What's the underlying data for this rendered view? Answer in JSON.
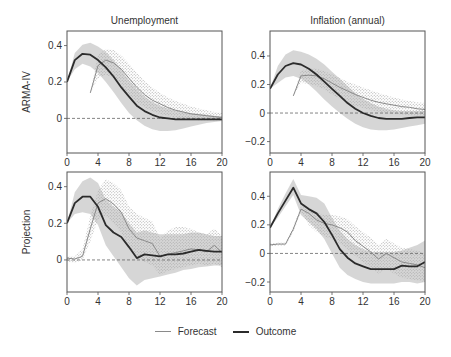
{
  "chart_data": {
    "type": "line",
    "layout": "2x2 grid of line charts with shaded uncertainty bands",
    "columns": [
      "Unemployment",
      "Inflation (annual)"
    ],
    "rows": [
      "ARMA-IV",
      "Projection"
    ],
    "legend": {
      "position": "bottom-center",
      "entries": [
        {
          "label": "Forecast",
          "color": "#8a8a8a",
          "width": 1
        },
        {
          "label": "Outcome",
          "color": "#2b2b2b",
          "width": 2
        }
      ]
    },
    "x_ticks": [
      0,
      4,
      8,
      12,
      16,
      20
    ],
    "xlim": [
      0,
      20
    ],
    "grid": false,
    "zero_line": "dashed",
    "panels": [
      {
        "id": "arma-unemployment",
        "row": "ARMA-IV",
        "column": "Unemployment",
        "ylim": [
          -0.19,
          0.48
        ],
        "y_ticks": [
          0,
          0.2,
          0.4
        ],
        "y_tick_labels": [
          "0",
          "0.2",
          "0.4"
        ],
        "outcome": {
          "x": [
            0,
            1,
            2,
            3,
            4,
            5,
            6,
            7,
            8,
            9,
            10,
            11,
            12,
            13,
            14,
            15,
            16,
            17,
            18,
            19,
            20
          ],
          "y": [
            0.2,
            0.32,
            0.355,
            0.35,
            0.32,
            0.28,
            0.23,
            0.17,
            0.12,
            0.07,
            0.04,
            0.02,
            0.005,
            0.0,
            -0.005,
            -0.005,
            -0.005,
            -0.005,
            -0.005,
            -0.005,
            -0.005
          ]
        },
        "outcome_band": {
          "lower": [
            0.2,
            0.27,
            0.3,
            0.285,
            0.25,
            0.2,
            0.145,
            0.085,
            0.03,
            -0.01,
            -0.04,
            -0.06,
            -0.07,
            -0.07,
            -0.065,
            -0.055,
            -0.045,
            -0.035,
            -0.025,
            -0.02,
            -0.015
          ],
          "upper": [
            0.2,
            0.36,
            0.405,
            0.415,
            0.395,
            0.365,
            0.32,
            0.265,
            0.21,
            0.16,
            0.12,
            0.09,
            0.07,
            0.055,
            0.045,
            0.035,
            0.03,
            0.025,
            0.02,
            0.015,
            0.01
          ]
        },
        "forecast": {
          "x": [
            3,
            4,
            5,
            6,
            7,
            8,
            9,
            10,
            11,
            12,
            13,
            14,
            15,
            16,
            17,
            18,
            19,
            20
          ],
          "y": [
            0.14,
            0.29,
            0.32,
            0.305,
            0.27,
            0.22,
            0.17,
            0.13,
            0.1,
            0.08,
            0.06,
            0.045,
            0.035,
            0.025,
            0.02,
            0.015,
            0.01,
            0.005
          ]
        },
        "forecast_band": {
          "lower": [
            0.14,
            0.22,
            0.24,
            0.22,
            0.18,
            0.13,
            0.09,
            0.06,
            0.04,
            0.025,
            0.015,
            0.005,
            0.0,
            -0.005,
            -0.01,
            -0.01,
            -0.01,
            -0.01
          ],
          "upper": [
            0.14,
            0.35,
            0.38,
            0.375,
            0.345,
            0.3,
            0.25,
            0.205,
            0.17,
            0.14,
            0.115,
            0.095,
            0.08,
            0.065,
            0.055,
            0.045,
            0.035,
            0.03
          ]
        }
      },
      {
        "id": "arma-inflation",
        "row": "ARMA-IV",
        "column": "Inflation (annual)",
        "ylim": [
          -0.28,
          0.575
        ],
        "y_ticks": [
          -0.2,
          0,
          0.2,
          0.4
        ],
        "y_tick_labels": [
          "−0.2",
          "0",
          "0.2",
          "0.4"
        ],
        "outcome": {
          "x": [
            0,
            1,
            2,
            3,
            4,
            5,
            6,
            7,
            8,
            9,
            10,
            11,
            12,
            13,
            14,
            15,
            16,
            17,
            18,
            19,
            20
          ],
          "y": [
            0.17,
            0.27,
            0.33,
            0.35,
            0.34,
            0.31,
            0.27,
            0.22,
            0.17,
            0.12,
            0.07,
            0.03,
            0.0,
            -0.02,
            -0.035,
            -0.04,
            -0.04,
            -0.04,
            -0.035,
            -0.03,
            -0.03
          ]
        },
        "outcome_band": {
          "lower": [
            0.17,
            0.21,
            0.25,
            0.26,
            0.24,
            0.2,
            0.15,
            0.095,
            0.045,
            0.0,
            -0.04,
            -0.075,
            -0.1,
            -0.115,
            -0.12,
            -0.12,
            -0.115,
            -0.105,
            -0.095,
            -0.085,
            -0.075
          ]
        },
        "outcome_band_upper": [
          0.17,
          0.33,
          0.41,
          0.44,
          0.43,
          0.41,
          0.38,
          0.34,
          0.29,
          0.24,
          0.19,
          0.14,
          0.1,
          0.07,
          0.045,
          0.03,
          0.02,
          0.015,
          0.015,
          0.015,
          0.015
        ],
        "forecast": {
          "x": [
            3,
            4,
            5,
            6,
            7,
            8,
            9,
            10,
            11,
            12,
            13,
            14,
            15,
            16,
            17,
            18,
            19,
            20
          ],
          "y": [
            0.12,
            0.26,
            0.265,
            0.26,
            0.24,
            0.21,
            0.18,
            0.155,
            0.13,
            0.11,
            0.09,
            0.075,
            0.065,
            0.055,
            0.045,
            0.04,
            0.03,
            0.025
          ]
        },
        "forecast_band": {
          "lower": [
            0.12,
            0.21,
            0.205,
            0.19,
            0.165,
            0.13,
            0.1,
            0.075,
            0.05,
            0.035,
            0.02,
            0.01,
            0.0,
            -0.005,
            -0.01,
            -0.015,
            -0.02,
            -0.02
          ],
          "upper": [
            0.12,
            0.3,
            0.31,
            0.31,
            0.295,
            0.27,
            0.245,
            0.22,
            0.2,
            0.18,
            0.16,
            0.14,
            0.125,
            0.11,
            0.095,
            0.085,
            0.075,
            0.07
          ]
        }
      },
      {
        "id": "projection-unemployment",
        "row": "Projection",
        "column": "Unemployment",
        "ylim": [
          -0.175,
          0.48
        ],
        "y_ticks": [
          0,
          0.2,
          0.4
        ],
        "y_tick_labels": [
          "0",
          "0.2",
          "0.4"
        ],
        "outcome": {
          "x": [
            0,
            1,
            2,
            3,
            4,
            5,
            6,
            7,
            8,
            9,
            10,
            11,
            12,
            13,
            14,
            15,
            16,
            17,
            18,
            19,
            20
          ],
          "y": [
            0.2,
            0.31,
            0.345,
            0.345,
            0.29,
            0.19,
            0.15,
            0.125,
            0.07,
            0.01,
            0.03,
            0.025,
            0.02,
            0.03,
            0.03,
            0.035,
            0.045,
            0.055,
            0.05,
            0.045,
            0.045
          ]
        },
        "outcome_band": {
          "lower": [
            0.2,
            0.25,
            0.26,
            0.25,
            0.19,
            0.08,
            0.02,
            -0.04,
            -0.1,
            -0.14,
            -0.11,
            -0.1,
            -0.09,
            -0.08,
            -0.07,
            -0.055,
            -0.05,
            -0.04,
            -0.035,
            -0.03,
            -0.03
          ],
          "upper": [
            0.2,
            0.37,
            0.43,
            0.45,
            0.42,
            0.33,
            0.29,
            0.26,
            0.2,
            0.15,
            0.16,
            0.15,
            0.14,
            0.14,
            0.14,
            0.14,
            0.15,
            0.15,
            0.14,
            0.13,
            0.13
          ]
        },
        "forecast": {
          "x": [
            0,
            1,
            2,
            3,
            4,
            5,
            6,
            7,
            8,
            9,
            10,
            11,
            12,
            13,
            14,
            15,
            16,
            17,
            18,
            19,
            20
          ],
          "y": [
            0.01,
            0.005,
            0.02,
            0.17,
            0.31,
            0.335,
            0.305,
            0.26,
            0.17,
            0.12,
            0.105,
            0.09,
            0.02,
            0.03,
            0.04,
            0.05,
            0.06,
            0.055,
            0.045,
            0.08,
            0.04
          ]
        },
        "forecast_band": {
          "lower": [
            -0.01,
            -0.015,
            0.0,
            0.1,
            0.22,
            0.24,
            0.2,
            0.15,
            0.06,
            0.01,
            -0.01,
            -0.03,
            -0.08,
            -0.06,
            -0.05,
            -0.04,
            -0.03,
            -0.02,
            -0.03,
            -0.02,
            -0.04
          ],
          "upper": [
            0.02,
            0.02,
            0.06,
            0.24,
            0.38,
            0.44,
            0.42,
            0.38,
            0.29,
            0.25,
            0.23,
            0.21,
            0.12,
            0.16,
            0.18,
            0.18,
            0.17,
            0.15,
            0.14,
            0.17,
            0.13
          ]
        }
      },
      {
        "id": "projection-inflation",
        "row": "Projection",
        "column": "Inflation (annual)",
        "ylim": [
          -0.27,
          0.57
        ],
        "y_ticks": [
          -0.2,
          0,
          0.2,
          0.4
        ],
        "y_tick_labels": [
          "−0.2",
          "0",
          "0.2",
          "0.4"
        ],
        "outcome": {
          "x": [
            0,
            1,
            2,
            3,
            4,
            5,
            6,
            7,
            8,
            9,
            10,
            11,
            12,
            13,
            14,
            15,
            16,
            17,
            18,
            19,
            20
          ],
          "y": [
            0.18,
            0.28,
            0.37,
            0.46,
            0.35,
            0.31,
            0.28,
            0.22,
            0.13,
            0.03,
            -0.03,
            -0.07,
            -0.09,
            -0.11,
            -0.11,
            -0.11,
            -0.11,
            -0.085,
            -0.09,
            -0.09,
            -0.06
          ]
        },
        "outcome_band": {
          "lower": [
            0.18,
            0.25,
            0.33,
            0.41,
            0.27,
            0.22,
            0.17,
            0.1,
            0.0,
            -0.1,
            -0.15,
            -0.18,
            -0.2,
            -0.21,
            -0.21,
            -0.21,
            -0.21,
            -0.2,
            -0.2,
            -0.21,
            -0.2
          ]
        },
        "outcome_band_upper": [
          0.18,
          0.31,
          0.42,
          0.52,
          0.41,
          0.4,
          0.39,
          0.35,
          0.25,
          0.16,
          0.1,
          0.06,
          0.03,
          0.01,
          0.01,
          0.01,
          0.01,
          0.02,
          0.04,
          0.06,
          0.09
        ],
        "forecast": {
          "x": [
            0,
            1,
            2,
            3,
            4,
            5,
            6,
            7,
            8,
            9,
            10,
            11,
            12,
            13,
            14,
            15,
            16,
            17,
            18,
            19,
            20
          ],
          "y": [
            0.06,
            0.065,
            0.065,
            0.17,
            0.31,
            0.28,
            0.235,
            0.21,
            0.2,
            0.18,
            0.15,
            0.09,
            0.05,
            0.01,
            -0.04,
            0.0,
            -0.03,
            -0.06,
            -0.07,
            -0.08,
            -0.1
          ]
        },
        "forecast_band": {
          "lower": [
            0.05,
            0.055,
            0.055,
            0.15,
            0.29,
            0.2,
            0.15,
            0.12,
            0.1,
            0.07,
            0.03,
            -0.02,
            -0.06,
            -0.1,
            -0.14,
            -0.11,
            -0.14,
            -0.17,
            -0.18,
            -0.19,
            -0.2
          ]
        },
        "forecast_band_upper": [
          0.07,
          0.075,
          0.075,
          0.19,
          0.33,
          0.31,
          0.29,
          0.27,
          0.27,
          0.26,
          0.24,
          0.19,
          0.15,
          0.11,
          0.06,
          0.1,
          0.07,
          0.04,
          0.03,
          0.02,
          0.0
        ]
      }
    ]
  },
  "figure": {
    "column_titles": [
      "Unemployment",
      "Inflation (annual)"
    ],
    "row_labels": [
      "ARMA-IV",
      "Projection"
    ],
    "legend": {
      "forecast_label": "Forecast",
      "outcome_label": "Outcome"
    },
    "colors": {
      "outcome_line": "#2b2b2b",
      "forecast_line": "#8a8a8a",
      "outcome_band": "#cfcfcf",
      "forecast_band_hatch": "#bdbdbd",
      "axis": "#555555",
      "zero_line": "#666666"
    }
  }
}
